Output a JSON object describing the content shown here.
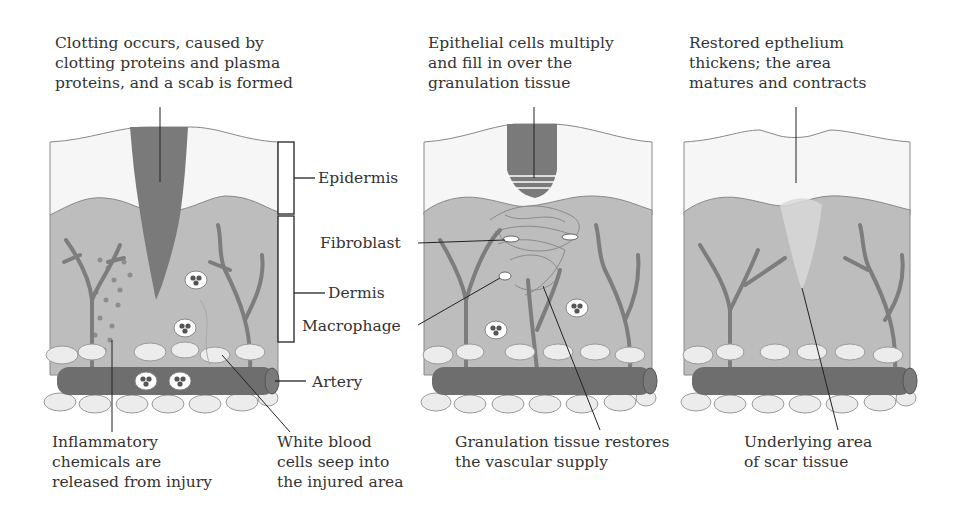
{
  "diagram": {
    "panels": [
      {
        "id": "stage-1",
        "caption_top": [
          "Clotting occurs, caused by",
          "clotting proteins and plasma",
          "proteins, and a scab is formed"
        ],
        "caption_bottom_left": [
          "Inflammatory",
          "chemicals are",
          "released from injury"
        ],
        "caption_bottom_right": [
          "White blood",
          "cells seep into",
          "the injured area"
        ]
      },
      {
        "id": "stage-2",
        "caption_top": [
          "Epithelial cells multiply",
          "and fill in over the",
          "granulation tissue"
        ],
        "caption_bottom": [
          "Granulation tissue restores",
          "the vascular supply"
        ]
      },
      {
        "id": "stage-3",
        "caption_top": [
          "Restored epthelium",
          "thickens; the area",
          "matures and contracts"
        ],
        "caption_bottom": [
          "Underlying area",
          "of scar tissue"
        ]
      }
    ],
    "side_labels": {
      "epidermis": "Epidermis",
      "fibroblast": "Fibroblast",
      "dermis": "Dermis",
      "macrophage": "Macrophage",
      "artery": "Artery"
    },
    "colors": {
      "epidermis": "#f6f6f6",
      "dermis": "#bdbdbd",
      "scab": "#7a7a7a",
      "artery": "#6e6e6e",
      "vessels": "#7d7d7d",
      "fat": "#ececec",
      "line": "#222222"
    }
  }
}
